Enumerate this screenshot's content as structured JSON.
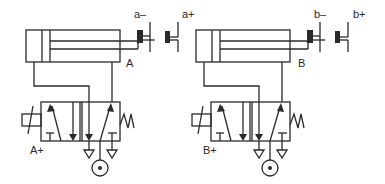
{
  "diagram": {
    "type": "pneumatic circuit",
    "colors": {
      "line": "#2a2a2a",
      "background": "#ffffff"
    },
    "circuits": [
      {
        "id": "A",
        "cylinder_label": "A",
        "limit_switches": [
          {
            "label": "a–"
          },
          {
            "label": "a+"
          }
        ],
        "valve_signal_label": "A+"
      },
      {
        "id": "B",
        "cylinder_label": "B",
        "limit_switches": [
          {
            "label": "b–"
          },
          {
            "label": "b+"
          }
        ],
        "valve_signal_label": "B+"
      }
    ]
  }
}
